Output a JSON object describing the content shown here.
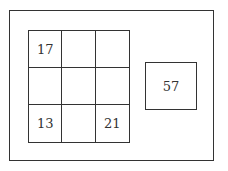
{
  "grid": {
    "rows": 3,
    "cols": 3,
    "cells": [
      [
        "17",
        "",
        ""
      ],
      [
        "",
        "",
        ""
      ],
      [
        "13",
        "",
        "21"
      ]
    ]
  },
  "side_box": {
    "value": "57"
  }
}
